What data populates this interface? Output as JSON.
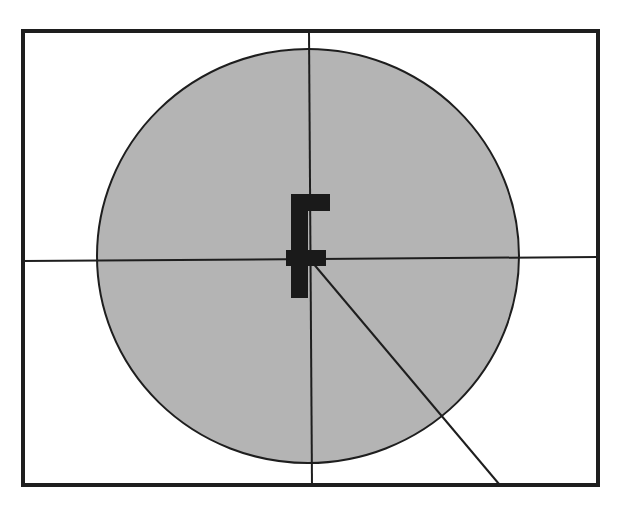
{
  "diagram": {
    "type": "reticle-target",
    "width": 623,
    "height": 508,
    "colors": {
      "background": "#ffffff",
      "stroke": "#1e1e1e",
      "circle_fill": "#b4b4b4",
      "glyph": "#1a1a1a"
    },
    "frame": {
      "x": 23,
      "y": 31,
      "w": 575,
      "h": 454,
      "stroke_width": 4
    },
    "circle": {
      "cx": 308,
      "cy": 256,
      "rx": 211,
      "ry": 207,
      "stroke_width": 2
    },
    "crosshair": {
      "vertical": {
        "x1": 309,
        "y1": 31,
        "x2": 312,
        "y2": 485
      },
      "horizontal": {
        "x1": 23,
        "y1": 261,
        "x2": 598,
        "y2": 257
      }
    },
    "radius_line": {
      "x1": 312,
      "y1": 262,
      "x2": 499,
      "y2": 484
    },
    "center_glyph": {
      "name": "F-shaped marker",
      "parts": [
        {
          "x": 291,
          "y": 194,
          "w": 17,
          "h": 104
        },
        {
          "x": 291,
          "y": 194,
          "w": 39,
          "h": 17
        },
        {
          "x": 286,
          "y": 250,
          "w": 40,
          "h": 16
        }
      ]
    }
  }
}
